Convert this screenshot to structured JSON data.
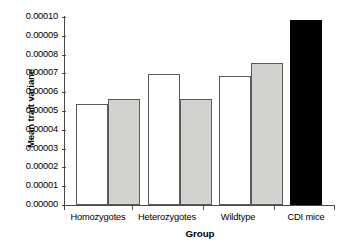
{
  "chart_data": {
    "type": "bar",
    "title": "",
    "xlabel": "Group",
    "ylabel": "Mean trait variane",
    "ylim": [
      0.0,
      0.0001
    ],
    "yticks": [
      "0.00000",
      "0.00001",
      "0.00002",
      "0.00003",
      "0.00004",
      "0.00005",
      "0.00006",
      "0.00007",
      "0.00008",
      "0.00009",
      "0.00010"
    ],
    "ytick_values": [
      0.0,
      1e-05,
      2e-05,
      3e-05,
      4e-05,
      5e-05,
      6e-05,
      7e-05,
      8e-05,
      9e-05,
      0.0001
    ],
    "categories": [
      "Homozygotes",
      "Heterozygotes",
      "Wildtype",
      "CDI mice"
    ],
    "grid": false,
    "legend": "none",
    "series": [
      {
        "name": "open",
        "fill": "#ffffff",
        "values": [
          5.35e-05,
          6.95e-05,
          6.85e-05,
          null
        ]
      },
      {
        "name": "shaded",
        "fill": "#d2d2ce",
        "values": [
          5.65e-05,
          5.65e-05,
          7.55e-05,
          null
        ]
      },
      {
        "name": "solid",
        "fill": "#000000",
        "values": [
          null,
          null,
          null,
          9.85e-05
        ]
      }
    ],
    "bars": [
      {
        "group": "Homozygotes",
        "style": "white",
        "value": 5.35e-05
      },
      {
        "group": "Homozygotes",
        "style": "gray",
        "value": 5.65e-05
      },
      {
        "group": "Heterozygotes",
        "style": "white",
        "value": 6.95e-05
      },
      {
        "group": "Heterozygotes",
        "style": "gray",
        "value": 5.65e-05
      },
      {
        "group": "Wildtype",
        "style": "white",
        "value": 6.85e-05
      },
      {
        "group": "Wildtype",
        "style": "gray",
        "value": 7.55e-05
      },
      {
        "group": "CDI mice",
        "style": "black",
        "value": 9.85e-05
      }
    ]
  },
  "colors": {
    "axis": "#4a4a4a",
    "bar_outline": "#5a5a5a",
    "bar_white": "#ffffff",
    "bar_gray": "#d2d2ce",
    "bar_black": "#000000",
    "background": "#ffffff"
  }
}
